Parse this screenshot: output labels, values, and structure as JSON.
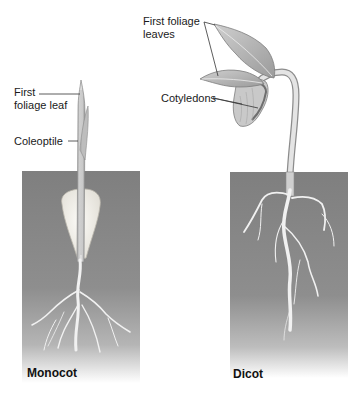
{
  "figure": {
    "colors": {
      "soil": "#8a8a8a",
      "soil_dark": "#777777",
      "plant_fill": "#d9d9d9",
      "plant_stroke": "#8c8c8c",
      "seed_fill": "#f4f2ec",
      "leader_line": "#333333",
      "root": "#f2f2f2"
    },
    "monocot": {
      "title": "Monocot",
      "labels": {
        "first_foliage_leaf_line1": "First",
        "first_foliage_leaf_line2": "foliage leaf",
        "coleoptile": "Coleoptile"
      }
    },
    "dicot": {
      "title": "Dicot",
      "labels": {
        "first_foliage_leaves_line1": "First foliage",
        "first_foliage_leaves_line2": "leaves",
        "cotyledons": "Cotyledons"
      }
    }
  }
}
